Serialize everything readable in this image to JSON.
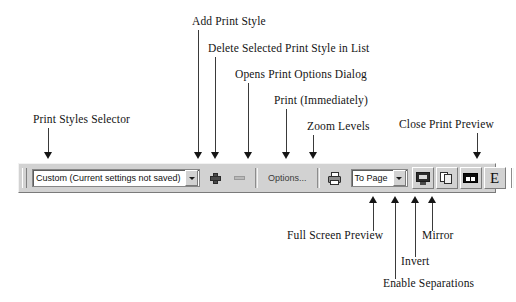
{
  "diagram": {
    "callouts_top": [
      {
        "id": "print-styles-selector",
        "label": "Print Styles Selector"
      },
      {
        "id": "add-print-style",
        "label": "Add Print Style"
      },
      {
        "id": "delete-selected-print-style",
        "label": "Delete Selected Print Style in List"
      },
      {
        "id": "opens-print-options-dialog",
        "label": "Opens Print Options Dialog"
      },
      {
        "id": "print-immediately",
        "label": "Print (Immediately)"
      },
      {
        "id": "zoom-levels",
        "label": "Zoom Levels"
      },
      {
        "id": "close-print-preview",
        "label": "Close Print Preview"
      }
    ],
    "callouts_bottom": [
      {
        "id": "full-screen-preview",
        "label": "Full Screen Preview"
      },
      {
        "id": "enable-separations",
        "label": "Enable Separations"
      },
      {
        "id": "invert",
        "label": "Invert"
      },
      {
        "id": "mirror",
        "label": "Mirror"
      }
    ]
  },
  "toolbar": {
    "print_styles_combo": {
      "value": "Custom (Current settings not saved)",
      "caret": "chevron-down-icon"
    },
    "add_style_icon": "plus-icon",
    "delete_style_icon": "minus-icon",
    "options_button": "Options...",
    "print_icon": "printer-icon",
    "zoom_combo": {
      "value": "To Page",
      "caret": "chevron-down-icon"
    },
    "full_screen_icon": "monitor-icon",
    "separations_icon": "stacked-pages-icon",
    "invert_icon": "invert-icon",
    "mirror_icon": "E",
    "close_button": "Close",
    "help_icon": "help-pointer-icon"
  },
  "colors": {
    "toolbar_face": "#d2d2d2",
    "field_bg": "#ffffff",
    "text": "#111111",
    "leader_line": "#3a3a3a"
  }
}
